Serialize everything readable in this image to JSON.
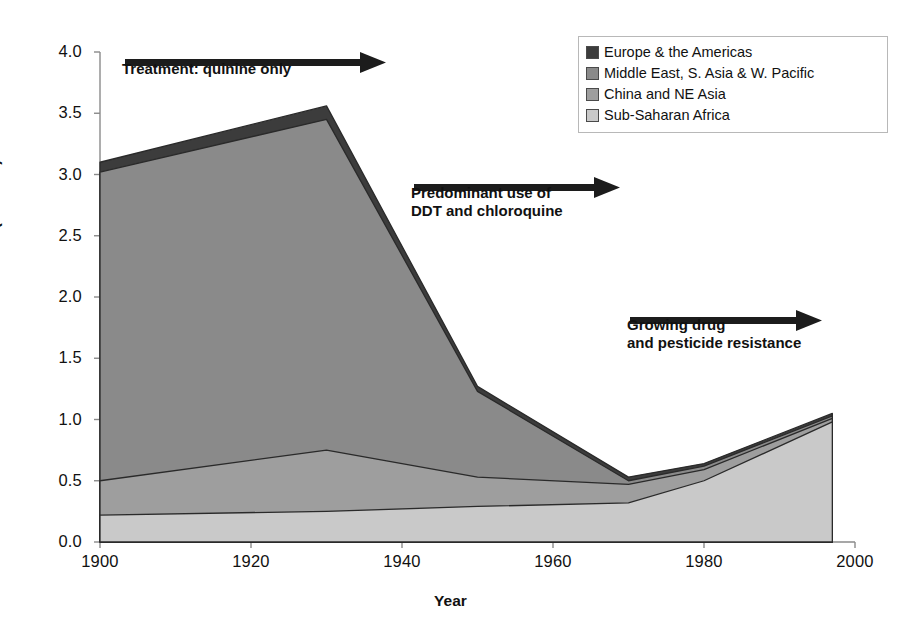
{
  "chart_data": {
    "type": "area",
    "stacked": true,
    "title": "",
    "xlabel": "Year",
    "ylabel": "Malaria deaths (millions)",
    "xlim": [
      1900,
      2000
    ],
    "ylim": [
      0.0,
      4.0
    ],
    "xticks": [
      "1900",
      "1920",
      "1940",
      "1960",
      "1980",
      "2000"
    ],
    "yticks": [
      "0.0",
      "0.5",
      "1.0",
      "1.5",
      "2.0",
      "2.5",
      "3.0",
      "3.5",
      "4.0"
    ],
    "grid": false,
    "legend_position": "top-right",
    "x": [
      1900,
      1930,
      1950,
      1970,
      1980,
      1997
    ],
    "series": [
      {
        "name": "Sub-Saharan Africa",
        "color": "#c9c9c9",
        "values": [
          0.22,
          0.25,
          0.29,
          0.32,
          0.5,
          0.98
        ]
      },
      {
        "name": "China and NE Asia",
        "color": "#9e9e9e",
        "values": [
          0.28,
          0.5,
          0.24,
          0.15,
          0.09,
          0.03
        ]
      },
      {
        "name": "Middle East, S. Asia & W. Pacific",
        "color": "#8a8a8a",
        "values": [
          2.52,
          2.7,
          0.7,
          0.03,
          0.03,
          0.02
        ]
      },
      {
        "name": "Europe & the Americas",
        "color": "#3c3c3c",
        "values": [
          0.08,
          0.11,
          0.04,
          0.03,
          0.02,
          0.02
        ]
      }
    ],
    "totals": [
      3.1,
      3.56,
      1.27,
      0.53,
      0.64,
      1.05
    ],
    "annotations": [
      {
        "id": "quinine",
        "text": "Treatment: quinine only",
        "arrow": "right"
      },
      {
        "id": "ddt",
        "text": "Predominant use of\nDDT and chloroquine",
        "arrow": "right"
      },
      {
        "id": "resistance",
        "text": "Growing drug\nand pesticide resistance",
        "arrow": "right"
      }
    ]
  },
  "legend": {
    "items": [
      {
        "label": "Europe & the Americas",
        "color": "#3c3c3c"
      },
      {
        "label": "Middle East, S. Asia & W. Pacific",
        "color": "#8a8a8a"
      },
      {
        "label": "China and NE Asia",
        "color": "#9e9e9e"
      },
      {
        "label": "Sub-Saharan Africa",
        "color": "#c9c9c9"
      }
    ]
  },
  "axes": {
    "y_title": "Malaria deaths (millions)",
    "x_title": "Year",
    "y_ticks": [
      "4.0",
      "3.5",
      "3.0",
      "2.5",
      "2.0",
      "1.5",
      "1.0",
      "0.5",
      "0.0"
    ],
    "x_ticks": [
      "1900",
      "1920",
      "1940",
      "1960",
      "1980",
      "2000"
    ]
  },
  "annotations": {
    "a1": "Treatment: quinine only",
    "a2": "Predominant use of\nDDT and chloroquine",
    "a3": "Growing drug\nand pesticide resistance"
  }
}
